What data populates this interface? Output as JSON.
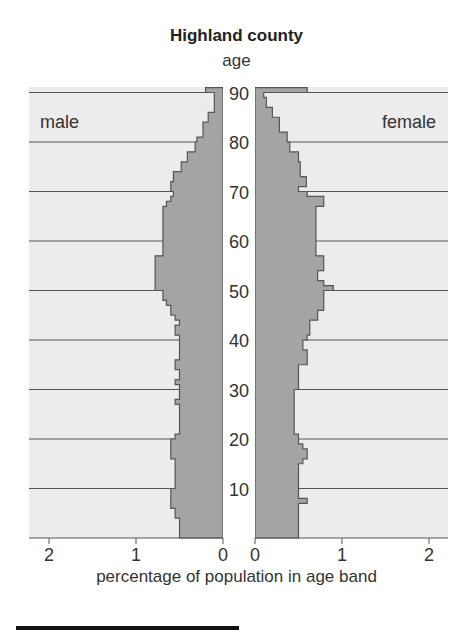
{
  "chart_data": {
    "type": "bar",
    "subtype": "population-pyramid",
    "title": "Highland county",
    "ylabel": "age",
    "xlabel": "percentage of population in age band",
    "left_label": "male",
    "right_label": "female",
    "y_ticks": [
      10,
      20,
      30,
      40,
      50,
      60,
      70,
      80,
      90
    ],
    "x_ticks_male": [
      2,
      1,
      0
    ],
    "x_ticks_female": [
      0,
      1,
      2
    ],
    "xlim": [
      0,
      2.2
    ],
    "ylim": [
      0,
      91
    ],
    "grid": "horizontal every 10 years",
    "ages": [
      0,
      1,
      2,
      3,
      4,
      5,
      6,
      7,
      8,
      9,
      10,
      11,
      12,
      13,
      14,
      15,
      16,
      17,
      18,
      19,
      20,
      21,
      22,
      23,
      24,
      25,
      26,
      27,
      28,
      29,
      30,
      31,
      32,
      33,
      34,
      35,
      36,
      37,
      38,
      39,
      40,
      41,
      42,
      43,
      44,
      45,
      46,
      47,
      48,
      49,
      50,
      51,
      52,
      53,
      54,
      55,
      56,
      57,
      58,
      59,
      60,
      61,
      62,
      63,
      64,
      65,
      66,
      67,
      68,
      69,
      70,
      71,
      72,
      73,
      74,
      75,
      76,
      77,
      78,
      79,
      80,
      81,
      82,
      83,
      84,
      85,
      86,
      87,
      88,
      89,
      90
    ],
    "series": [
      {
        "name": "male",
        "values": [
          0.5,
          0.5,
          0.5,
          0.5,
          0.55,
          0.55,
          0.6,
          0.6,
          0.6,
          0.6,
          0.55,
          0.55,
          0.55,
          0.55,
          0.55,
          0.55,
          0.6,
          0.6,
          0.6,
          0.6,
          0.55,
          0.5,
          0.5,
          0.5,
          0.5,
          0.5,
          0.5,
          0.55,
          0.5,
          0.5,
          0.5,
          0.55,
          0.5,
          0.5,
          0.55,
          0.55,
          0.5,
          0.5,
          0.5,
          0.5,
          0.5,
          0.55,
          0.55,
          0.5,
          0.55,
          0.6,
          0.6,
          0.65,
          0.69,
          0.69,
          0.78,
          0.78,
          0.78,
          0.78,
          0.78,
          0.78,
          0.78,
          0.69,
          0.69,
          0.69,
          0.69,
          0.69,
          0.69,
          0.69,
          0.69,
          0.69,
          0.69,
          0.65,
          0.6,
          0.57,
          0.6,
          0.6,
          0.57,
          0.57,
          0.48,
          0.48,
          0.41,
          0.41,
          0.32,
          0.32,
          0.3,
          0.23,
          0.23,
          0.23,
          0.17,
          0.17,
          0.1,
          0.1,
          0.1,
          0.1,
          0.2
        ]
      },
      {
        "name": "female",
        "values": [
          0.5,
          0.5,
          0.5,
          0.5,
          0.5,
          0.5,
          0.5,
          0.6,
          0.5,
          0.5,
          0.5,
          0.5,
          0.5,
          0.5,
          0.5,
          0.55,
          0.6,
          0.6,
          0.55,
          0.5,
          0.5,
          0.45,
          0.45,
          0.45,
          0.45,
          0.45,
          0.45,
          0.45,
          0.45,
          0.45,
          0.5,
          0.5,
          0.5,
          0.5,
          0.5,
          0.6,
          0.6,
          0.6,
          0.55,
          0.55,
          0.6,
          0.63,
          0.63,
          0.63,
          0.72,
          0.72,
          0.79,
          0.79,
          0.79,
          0.79,
          0.9,
          0.79,
          0.72,
          0.72,
          0.79,
          0.79,
          0.79,
          0.7,
          0.7,
          0.7,
          0.7,
          0.7,
          0.7,
          0.7,
          0.7,
          0.7,
          0.7,
          0.79,
          0.79,
          0.6,
          0.5,
          0.59,
          0.59,
          0.52,
          0.52,
          0.52,
          0.5,
          0.5,
          0.4,
          0.4,
          0.37,
          0.37,
          0.28,
          0.28,
          0.28,
          0.2,
          0.2,
          0.13,
          0.13,
          0.1,
          0.6
        ]
      }
    ],
    "colors": {
      "bar_fill": "#a4a4a4",
      "bar_edge": "#555555",
      "band_bg": "#ececec",
      "gridline": "#555555"
    }
  }
}
